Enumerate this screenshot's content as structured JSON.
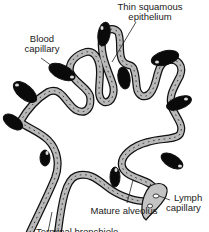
{
  "diagram": {
    "labels": {
      "thin_squamous": [
        "Thin squamous",
        "epithelium"
      ],
      "blood_capillary": [
        "Blood",
        "capillary"
      ],
      "lymph_capillary": [
        "Lymph",
        "capillary"
      ],
      "mature_alveolus": "Mature alveolus",
      "terminal_bronchiole": "Terminal bronchiole"
    },
    "colors": {
      "wall_fill": "#b9b9b9",
      "outline": "#111111",
      "capillary_fill": "#0a0a0a",
      "background": "#ffffff"
    }
  }
}
